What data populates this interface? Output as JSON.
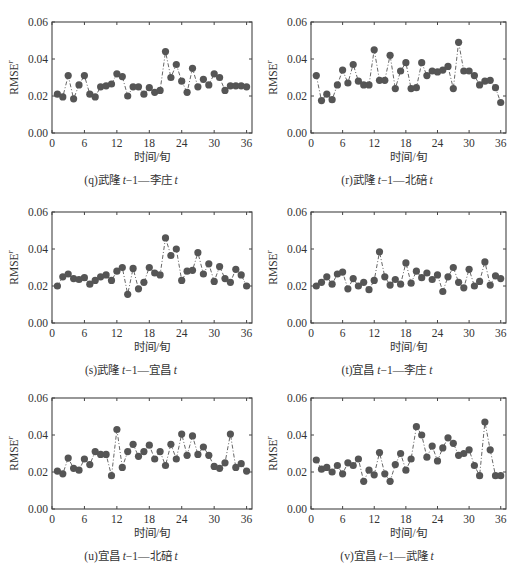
{
  "figure": {
    "ylabel": "RMSE",
    "ylabel_superscript": "r",
    "xlabel": "时间/旬"
  },
  "chart_data": [
    {
      "id": "q",
      "type": "line",
      "caption_prefix": "(q)武隆 ",
      "caption_italic_1": "t",
      "caption_mid": "−1—李庄 ",
      "caption_italic_2": "t",
      "xlabel": "时间/旬",
      "ylabel": "RMSE^r",
      "xlim": [
        0,
        37
      ],
      "ylim": [
        0,
        0.06
      ],
      "xticks": [
        0,
        6,
        12,
        18,
        24,
        30,
        36
      ],
      "yticks": [
        "0.00",
        "0.02",
        "0.04",
        "0.06"
      ],
      "x": [
        1,
        2,
        3,
        4,
        5,
        6,
        7,
        8,
        9,
        10,
        11,
        12,
        13,
        14,
        15,
        16,
        17,
        18,
        19,
        20,
        21,
        22,
        23,
        24,
        25,
        26,
        27,
        28,
        29,
        30,
        31,
        32,
        33,
        34,
        35,
        36
      ],
      "values": [
        0.021,
        0.0195,
        0.031,
        0.0185,
        0.026,
        0.031,
        0.021,
        0.0195,
        0.025,
        0.0255,
        0.0265,
        0.032,
        0.0305,
        0.02,
        0.025,
        0.025,
        0.021,
        0.0245,
        0.022,
        0.023,
        0.044,
        0.03,
        0.037,
        0.028,
        0.022,
        0.035,
        0.025,
        0.029,
        0.026,
        0.032,
        0.03,
        0.023,
        0.0255,
        0.0255,
        0.0255,
        0.025
      ],
      "line_style": "dash-dot",
      "marker": "filled-circle"
    },
    {
      "id": "r",
      "type": "line",
      "caption_prefix": "(r)武隆 ",
      "caption_italic_1": "t",
      "caption_mid": "−1—北碚 ",
      "caption_italic_2": "t",
      "xlabel": "时间/旬",
      "ylabel": "RMSE^r",
      "xlim": [
        0,
        37
      ],
      "ylim": [
        0,
        0.06
      ],
      "xticks": [
        0,
        6,
        12,
        18,
        24,
        30,
        36
      ],
      "yticks": [
        "0.00",
        "0.02",
        "0.04",
        "0.06"
      ],
      "x": [
        1,
        2,
        3,
        4,
        5,
        6,
        7,
        8,
        9,
        10,
        11,
        12,
        13,
        14,
        15,
        16,
        17,
        18,
        19,
        20,
        21,
        22,
        23,
        24,
        25,
        26,
        27,
        28,
        29,
        30,
        31,
        32,
        33,
        34,
        35,
        36
      ],
      "values": [
        0.031,
        0.0175,
        0.021,
        0.018,
        0.026,
        0.034,
        0.027,
        0.037,
        0.028,
        0.026,
        0.026,
        0.045,
        0.0285,
        0.0285,
        0.042,
        0.024,
        0.0335,
        0.038,
        0.024,
        0.0245,
        0.038,
        0.031,
        0.0335,
        0.033,
        0.034,
        0.036,
        0.024,
        0.049,
        0.0335,
        0.0335,
        0.031,
        0.026,
        0.028,
        0.0285,
        0.0245,
        0.0165
      ],
      "line_style": "dash-dot",
      "marker": "filled-circle"
    },
    {
      "id": "s",
      "type": "line",
      "caption_prefix": "(s)武隆 ",
      "caption_italic_1": "t",
      "caption_mid": "−1—宜昌 ",
      "caption_italic_2": "t",
      "xlabel": "时间/旬",
      "ylabel": "RMSE^r",
      "xlim": [
        0,
        37
      ],
      "ylim": [
        0,
        0.06
      ],
      "xticks": [
        0,
        6,
        12,
        18,
        24,
        30,
        36
      ],
      "yticks": [
        "0.00",
        "0.02",
        "0.04",
        "0.06"
      ],
      "x": [
        1,
        2,
        3,
        4,
        5,
        6,
        7,
        8,
        9,
        10,
        11,
        12,
        13,
        14,
        15,
        16,
        17,
        18,
        19,
        20,
        21,
        22,
        23,
        24,
        25,
        26,
        27,
        28,
        29,
        30,
        31,
        32,
        33,
        34,
        35,
        36
      ],
      "values": [
        0.02,
        0.025,
        0.0265,
        0.024,
        0.0235,
        0.0245,
        0.021,
        0.023,
        0.025,
        0.026,
        0.023,
        0.028,
        0.03,
        0.0155,
        0.0295,
        0.0185,
        0.022,
        0.03,
        0.027,
        0.026,
        0.046,
        0.0365,
        0.04,
        0.023,
        0.028,
        0.0285,
        0.038,
        0.0265,
        0.032,
        0.0225,
        0.0305,
        0.024,
        0.022,
        0.029,
        0.026,
        0.02
      ],
      "line_style": "dash-dot",
      "marker": "filled-circle"
    },
    {
      "id": "t",
      "type": "line",
      "caption_prefix": "(t)宜昌 ",
      "caption_italic_1": "t",
      "caption_mid": "−1—李庄 ",
      "caption_italic_2": "t",
      "xlabel": "时间/旬",
      "ylabel": "RMSE^r",
      "xlim": [
        0,
        37
      ],
      "ylim": [
        0,
        0.06
      ],
      "xticks": [
        0,
        6,
        12,
        18,
        24,
        30,
        36
      ],
      "yticks": [
        "0.00",
        "0.02",
        "0.04",
        "0.06"
      ],
      "x": [
        1,
        2,
        3,
        4,
        5,
        6,
        7,
        8,
        9,
        10,
        11,
        12,
        13,
        14,
        15,
        16,
        17,
        18,
        19,
        20,
        21,
        22,
        23,
        24,
        25,
        26,
        27,
        28,
        29,
        30,
        31,
        32,
        33,
        34,
        35,
        36
      ],
      "values": [
        0.02,
        0.022,
        0.025,
        0.021,
        0.0265,
        0.0275,
        0.0185,
        0.024,
        0.02,
        0.022,
        0.018,
        0.023,
        0.0385,
        0.025,
        0.0205,
        0.0235,
        0.021,
        0.0325,
        0.0215,
        0.028,
        0.0245,
        0.027,
        0.0235,
        0.026,
        0.017,
        0.025,
        0.03,
        0.022,
        0.019,
        0.029,
        0.02,
        0.0225,
        0.033,
        0.0205,
        0.0255,
        0.024
      ],
      "line_style": "dash-dot",
      "marker": "filled-circle"
    },
    {
      "id": "u",
      "type": "line",
      "caption_prefix": "(u)宜昌 ",
      "caption_italic_1": "t",
      "caption_mid": "−1—北碚 ",
      "caption_italic_2": "t",
      "xlabel": "时间/旬",
      "ylabel": "RMSE^r",
      "xlim": [
        0,
        37
      ],
      "ylim": [
        0,
        0.06
      ],
      "xticks": [
        0,
        6,
        12,
        18,
        24,
        30,
        36
      ],
      "yticks": [
        "0.00",
        "0.02",
        "0.04",
        "0.06"
      ],
      "x": [
        1,
        2,
        3,
        4,
        5,
        6,
        7,
        8,
        9,
        10,
        11,
        12,
        13,
        14,
        15,
        16,
        17,
        18,
        19,
        20,
        21,
        22,
        23,
        24,
        25,
        26,
        27,
        28,
        29,
        30,
        31,
        32,
        33,
        34,
        35,
        36
      ],
      "values": [
        0.0205,
        0.019,
        0.0275,
        0.022,
        0.021,
        0.027,
        0.024,
        0.031,
        0.0295,
        0.0295,
        0.018,
        0.043,
        0.0225,
        0.031,
        0.035,
        0.0285,
        0.031,
        0.0345,
        0.027,
        0.031,
        0.0235,
        0.035,
        0.027,
        0.0405,
        0.029,
        0.0395,
        0.0295,
        0.0335,
        0.029,
        0.023,
        0.022,
        0.025,
        0.0405,
        0.0225,
        0.0245,
        0.0205
      ],
      "line_style": "dash-dot",
      "marker": "filled-circle"
    },
    {
      "id": "v",
      "type": "line",
      "caption_prefix": "(v)宜昌 ",
      "caption_italic_1": "t",
      "caption_mid": "−1—武隆 ",
      "caption_italic_2": "t",
      "xlabel": "时间/旬",
      "ylabel": "RMSE^r",
      "xlim": [
        0,
        37
      ],
      "ylim": [
        0,
        0.06
      ],
      "xticks": [
        0,
        6,
        12,
        18,
        24,
        30,
        36
      ],
      "yticks": [
        "0.00",
        "0.02",
        "0.04",
        "0.06"
      ],
      "x": [
        1,
        2,
        3,
        4,
        5,
        6,
        7,
        8,
        9,
        10,
        11,
        12,
        13,
        14,
        15,
        16,
        17,
        18,
        19,
        20,
        21,
        22,
        23,
        24,
        25,
        26,
        27,
        28,
        29,
        30,
        31,
        32,
        33,
        34,
        35,
        36
      ],
      "values": [
        0.0265,
        0.0215,
        0.0225,
        0.02,
        0.0235,
        0.019,
        0.025,
        0.0235,
        0.027,
        0.015,
        0.021,
        0.0185,
        0.0305,
        0.019,
        0.015,
        0.024,
        0.03,
        0.021,
        0.027,
        0.0445,
        0.04,
        0.028,
        0.034,
        0.026,
        0.033,
        0.0385,
        0.0355,
        0.029,
        0.03,
        0.032,
        0.0235,
        0.018,
        0.047,
        0.032,
        0.018,
        0.018
      ],
      "line_style": "dash-dot",
      "marker": "filled-circle"
    }
  ]
}
